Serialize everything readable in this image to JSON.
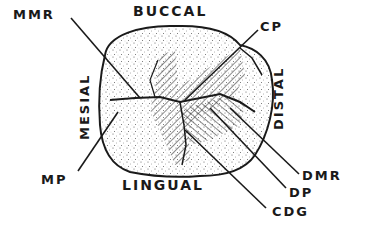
{
  "diagram": {
    "surfaces": {
      "top": "BUCCAL",
      "bottom": "LINGUAL",
      "left": "MESIAL",
      "right": "DISTAL"
    },
    "callouts": [
      {
        "id": "mmr",
        "label": "MMR"
      },
      {
        "id": "cp",
        "label": "CP"
      },
      {
        "id": "mp",
        "label": "MP"
      },
      {
        "id": "dmr",
        "label": "DMR"
      },
      {
        "id": "dp",
        "label": "DP"
      },
      {
        "id": "cdg",
        "label": "CDG"
      }
    ],
    "colors": {
      "ink": "#1a1a1a",
      "background": "#ffffff",
      "stipple": "#555555"
    }
  }
}
